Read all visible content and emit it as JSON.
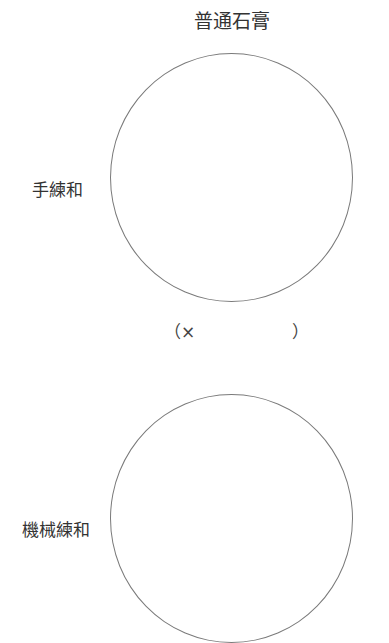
{
  "title": "普通石膏",
  "rows": [
    {
      "label": "手練和"
    },
    {
      "label": "機械練和"
    }
  ],
  "magnification": {
    "open": "（×",
    "value": "",
    "close": "）"
  }
}
